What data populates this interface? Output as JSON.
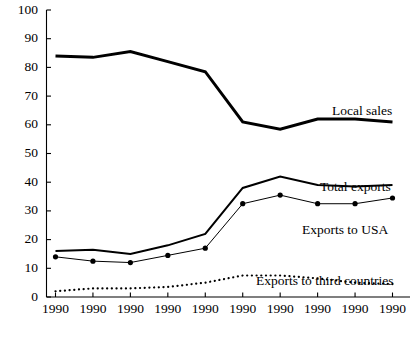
{
  "chart_data": {
    "type": "line",
    "title": "",
    "xlabel": "",
    "ylabel": "",
    "ylim": [
      0,
      100
    ],
    "ytick_step": 10,
    "grid": false,
    "legend_position": "inline-right-labels",
    "categories": [
      "1990",
      "1990",
      "1990",
      "1990",
      "1990",
      "1990",
      "1990",
      "1990",
      "1990",
      "1990"
    ],
    "ytick_labels": [
      "0",
      "10",
      "20",
      "30",
      "40",
      "50",
      "60",
      "70",
      "80",
      "90",
      "100"
    ],
    "series": [
      {
        "name": "Local sales",
        "style": "thick-solid",
        "markers": false,
        "values": [
          84,
          83.5,
          85.5,
          82,
          78.5,
          61,
          58.5,
          62,
          62,
          61
        ]
      },
      {
        "name": "Total exports",
        "style": "medium-solid",
        "markers": false,
        "values": [
          16,
          16.5,
          15,
          18,
          22,
          38,
          42,
          39,
          38.5,
          39
        ]
      },
      {
        "name": "Exports to USA",
        "style": "thin-solid",
        "markers": true,
        "values": [
          14,
          12.5,
          12,
          14.5,
          17,
          32.5,
          35.5,
          32.5,
          32.5,
          34.5
        ]
      },
      {
        "name": "Exports to third countries",
        "style": "dotted",
        "markers": false,
        "values": [
          2,
          3,
          3,
          3.5,
          5,
          7.5,
          7.5,
          6.5,
          5,
          4.5
        ]
      }
    ],
    "annotations": [
      {
        "text": "Local sales",
        "x": 332,
        "y": 112
      },
      {
        "text": "Total exports",
        "x": 320,
        "y": 188
      },
      {
        "text": "Exports to USA",
        "x": 302,
        "y": 231
      },
      {
        "text": "Exports to third countries",
        "x": 256,
        "y": 282
      }
    ]
  },
  "colors": {
    "axis": "#000000",
    "series_line": "#000000",
    "background": "#ffffff",
    "text": "#000000"
  }
}
